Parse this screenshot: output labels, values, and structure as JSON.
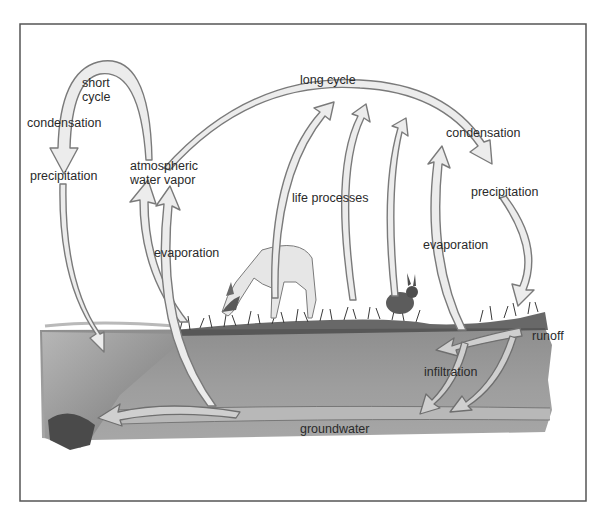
{
  "diagram": {
    "labels": {
      "short_cycle_line1": "short",
      "short_cycle_line2": "cycle",
      "condensation_left": "condensation",
      "precipitation_left": "precipitation",
      "atmospheric_line1": "atmospheric",
      "atmospheric_line2": "water vapor",
      "long_cycle": "long cycle",
      "life_processes": "life processes",
      "condensation_right": "condensation",
      "precipitation_right": "precipitation",
      "evaporation_left": "evaporation",
      "evaporation_right": "evaporation",
      "runoff": "runoff",
      "infiltration": "infiltration",
      "groundwater": "groundwater"
    },
    "illustrations": [
      "deer",
      "rabbit",
      "grass",
      "soil",
      "groundwater-layer",
      "pond"
    ],
    "colors": {
      "arrow_fill": "#ececec",
      "arrow_stroke": "#7a7a7a",
      "soil": "#9c9c9c",
      "groundwater_band": "#b4b4b4",
      "frame": "#555555",
      "text": "#2a2a2a"
    }
  }
}
